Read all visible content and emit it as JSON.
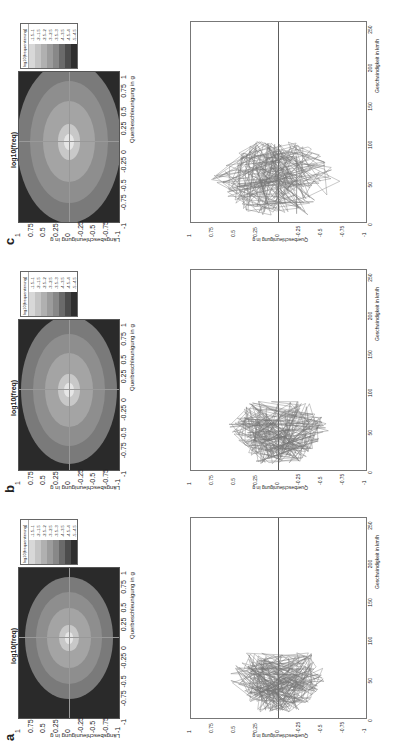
{
  "chart_data": [
    {
      "id": "a-heatmap",
      "panel": "a",
      "type": "heatmap",
      "title": "log10(freq)",
      "xlabel": "Querbeschleunigung in g",
      "ylabel": "Längsbeschleunigung in g",
      "xticks": [
        "-1",
        "-0.75",
        "-0.5",
        "-0.25",
        "0",
        "0.25",
        "0.5",
        "0.75",
        "1"
      ],
      "yticks": [
        "1",
        "0.75",
        "0.5",
        "0.25",
        "0",
        "-0.25",
        "-0.5",
        "-0.75",
        "-1"
      ],
      "xlim": [
        -1,
        1
      ],
      "ylim": [
        -1,
        1
      ],
      "legend_title": "log10(frequentierung)",
      "legend": [
        "-1.5--1",
        "-2--1.5",
        "-2.5--2",
        "-3--2.5",
        "-3.5--3",
        "-4--3.5",
        "-4.5--4",
        "-5--4.5"
      ]
    },
    {
      "id": "b-heatmap",
      "panel": "b",
      "type": "heatmap",
      "title": "log10(freq)",
      "xlabel": "Querbeschleunigung in g",
      "ylabel": "Längsbeschleunigung in g",
      "xticks": [
        "-1",
        "-0.75",
        "-0.5",
        "-0.25",
        "0",
        "0.25",
        "0.5",
        "0.75",
        "1"
      ],
      "yticks": [
        "1",
        "0.75",
        "0.5",
        "0.25",
        "0",
        "-0.25",
        "-0.5",
        "-0.75",
        "-1"
      ],
      "xlim": [
        -1,
        1
      ],
      "ylim": [
        -1,
        1
      ],
      "legend_title": "log10(frequentierung)",
      "legend": [
        "-1.5--1",
        "-2--1.5",
        "-2.5--2",
        "-3--2.5",
        "-3.5--3",
        "-4--3.5",
        "-4.5--4",
        "-5--4.5"
      ]
    },
    {
      "id": "c-heatmap",
      "panel": "c",
      "type": "heatmap",
      "title": "log10(freq)",
      "xlabel": "Querbeschleunigung in g",
      "ylabel": "Längsbeschleunigung in g",
      "xticks": [
        "-1",
        "-0.75",
        "-0.5",
        "-0.25",
        "0",
        "0.25",
        "0.5",
        "0.75",
        "1"
      ],
      "yticks": [
        "1",
        "0.75",
        "0.5",
        "0.25",
        "0",
        "-0.25",
        "-0.5",
        "-0.75",
        "-1"
      ],
      "xlim": [
        -1,
        1
      ],
      "ylim": [
        -1,
        1
      ],
      "legend_title": "log10(frequentierung)",
      "legend": [
        "-1.5--1",
        "-2--1.5",
        "-2.5--2",
        "-3--2.5",
        "-3.5--3",
        "-4--3.5",
        "-4.5--4",
        "-5--4.5"
      ]
    },
    {
      "id": "a-line",
      "panel": "a",
      "type": "line",
      "xlabel": "Geschwindigkeit in km/h",
      "ylabel": "Querbeschleunigung in g",
      "xticks": [
        "0",
        "50",
        "100",
        "150",
        "200",
        "250"
      ],
      "yticks": [
        "1",
        "0.75",
        "0.5",
        "0.25",
        "0",
        "-0.25",
        "-0.5",
        "-0.75",
        "-1"
      ],
      "xlim": [
        0,
        260
      ],
      "ylim": [
        -1,
        1
      ],
      "description": "Dense oscillating trace concentrated between ~0 and ~85 km/h, lateral acceleration mostly within ±0.6 g"
    },
    {
      "id": "b-line",
      "panel": "b",
      "type": "line",
      "xlabel": "Geschwindigkeit in km/h",
      "ylabel": "Querbeschleunigung in g",
      "xticks": [
        "0",
        "50",
        "100",
        "150",
        "200",
        "250"
      ],
      "yticks": [
        "1",
        "0.75",
        "0.5",
        "0.25",
        "0",
        "-0.25",
        "-0.5",
        "-0.75",
        "-1"
      ],
      "xlim": [
        0,
        260
      ],
      "ylim": [
        -1,
        1
      ],
      "description": "Dense oscillating trace between ~0 and ~90 km/h, lateral acceleration mostly within ±0.6 g"
    },
    {
      "id": "c-line",
      "panel": "c",
      "type": "line",
      "xlabel": "Geschwindigkeit in km/h",
      "ylabel": "Querbeschleunigung in g",
      "xticks": [
        "0",
        "50",
        "100",
        "150",
        "200",
        "250"
      ],
      "yticks": [
        "1",
        "0.75",
        "0.5",
        "0.25",
        "0",
        "-0.25",
        "-0.5",
        "-0.75",
        "-1"
      ],
      "xlim": [
        0,
        260
      ],
      "ylim": [
        -1,
        1
      ],
      "description": "Dense oscillating trace between ~0 and ~105 km/h, lateral acceleration mostly within ±0.8 g"
    }
  ],
  "panels": {
    "a": {
      "letter": "a"
    },
    "b": {
      "letter": "b"
    },
    "c": {
      "letter": "c"
    }
  },
  "colors": {
    "heatmap_bg": "#2a2a2a",
    "legend_swatches": [
      "#d8d8d8",
      "#c4c4c4",
      "#b0b0b0",
      "#9c9c9c",
      "#888888",
      "#6a6a6a",
      "#4c4c4c",
      "#2e2e2e"
    ],
    "line_trace": "#777777"
  }
}
